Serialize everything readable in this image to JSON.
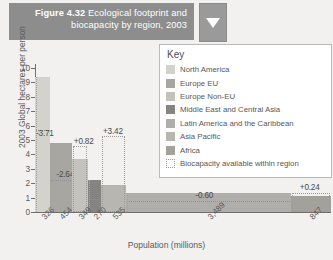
{
  "header": {
    "figure_number": "Figure 4.32",
    "title": "Ecological footprint and biocapacity by region, 2003",
    "dropdown_icon": "chevron-down-icon"
  },
  "legend": {
    "title": "Key",
    "items": [
      {
        "label": "North America",
        "color": "#d4d2cd"
      },
      {
        "label": "Europe EU",
        "color": "#a8a6a1"
      },
      {
        "label": "Europe Non-EU",
        "color": "#c4c2bd"
      },
      {
        "label": "Middle East and Central Asia",
        "color": "#858480"
      },
      {
        "label": "Latin America and the Caribbean",
        "color": "#b0aeaa"
      },
      {
        "label": "Asia Pacific",
        "color": "#b8b6b1"
      },
      {
        "label": "Africa",
        "color": "#a3a19c"
      },
      {
        "label": "Biocapacity available within region",
        "color": "dotted"
      }
    ]
  },
  "chart_data": {
    "type": "bar",
    "title": "Ecological footprint and biocapacity by region, 2003",
    "xlabel": "Population (millions)",
    "ylabel": "2003 Global hectares per person",
    "ylim": [
      0,
      10
    ],
    "yticks": [
      "0",
      "1",
      "2",
      "3",
      "4",
      "5",
      "6",
      "7",
      "8",
      "9",
      "10"
    ],
    "grid": false,
    "legend_position": "right",
    "x_axis_note": "bar width proportional to population",
    "categories": [
      "North America",
      "Europe EU",
      "Europe Non-EU",
      "Middle East and Central Asia",
      "Asia Pacific",
      "Latin America and the Caribbean",
      "Africa"
    ],
    "population_millions": [
      "326",
      "454",
      "349",
      "270",
      "535",
      "3,489",
      "847"
    ],
    "footprint_values": [
      9.4,
      4.8,
      3.7,
      2.2,
      1.9,
      1.3,
      1.1
    ],
    "biocapacity_values": [
      5.7,
      2.2,
      4.55,
      0.9,
      5.3,
      0.73,
      1.34
    ],
    "balance_labels": [
      "-3.71",
      "-2.64",
      "+0.82",
      "",
      "+3.42",
      "-0.60",
      "+0.24"
    ],
    "annotations": [
      {
        "text": "-3.71",
        "series": "North America"
      },
      {
        "text": "-2.64",
        "series": "Europe EU"
      },
      {
        "text": "+0.82",
        "series": "Europe Non-EU"
      },
      {
        "text": "+3.42",
        "series": "Asia Pacific"
      },
      {
        "text": "-0.60",
        "series": "Latin America and the Caribbean"
      },
      {
        "text": "+0.24",
        "series": "Africa"
      }
    ]
  }
}
